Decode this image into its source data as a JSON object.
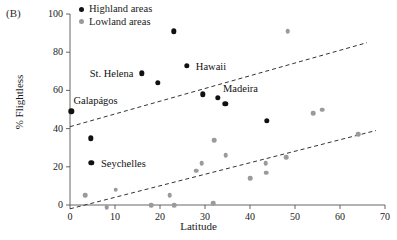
{
  "panel": {
    "label": "(B)"
  },
  "legend": {
    "items": [
      {
        "label": "Highland areas",
        "color": "#111111",
        "name": "highland"
      },
      {
        "label": "Lowland areas",
        "color": "#9a9a9a",
        "name": "lowland"
      }
    ]
  },
  "chart_data": {
    "type": "scatter",
    "title": "",
    "xlabel": "Latitude",
    "ylabel": "% Flightless",
    "xlim": [
      0,
      70
    ],
    "ylim": [
      0,
      100
    ],
    "xticks": [
      0,
      10,
      20,
      30,
      40,
      50,
      60,
      70
    ],
    "yticks": [
      0,
      20,
      40,
      60,
      80,
      100
    ],
    "grid": false,
    "legend_position": "top-left",
    "series": [
      {
        "name": "Highland areas",
        "color": "#111111",
        "points": [
          {
            "x": 0.3,
            "y": 49,
            "label": "Galapagos"
          },
          {
            "x": 4.6,
            "y": 35,
            "label": ""
          },
          {
            "x": 4.7,
            "y": 22,
            "label": "Seychelles"
          },
          {
            "x": 16.0,
            "y": 69,
            "label": "St. Helena"
          },
          {
            "x": 19.5,
            "y": 64,
            "label": ""
          },
          {
            "x": 23.0,
            "y": 91,
            "label": ""
          },
          {
            "x": 26.0,
            "y": 73,
            "label": "Hawaii"
          },
          {
            "x": 29.5,
            "y": 58,
            "label": ""
          },
          {
            "x": 32.8,
            "y": 56,
            "label": "Madeira"
          },
          {
            "x": 34.5,
            "y": 53,
            "label": ""
          },
          {
            "x": 43.8,
            "y": 44,
            "label": ""
          }
        ]
      },
      {
        "name": "Lowland areas",
        "color": "#9a9a9a",
        "points": [
          {
            "x": 3.4,
            "y": 5
          },
          {
            "x": 8.2,
            "y": -1
          },
          {
            "x": 10.2,
            "y": 8
          },
          {
            "x": 18.0,
            "y": 0
          },
          {
            "x": 22.2,
            "y": 5
          },
          {
            "x": 23.2,
            "y": 0
          },
          {
            "x": 28.0,
            "y": 18
          },
          {
            "x": 29.3,
            "y": 22
          },
          {
            "x": 31.8,
            "y": 1
          },
          {
            "x": 32.0,
            "y": 34
          },
          {
            "x": 34.6,
            "y": 26
          },
          {
            "x": 40.0,
            "y": 14
          },
          {
            "x": 43.5,
            "y": 22
          },
          {
            "x": 43.6,
            "y": 17
          },
          {
            "x": 48.0,
            "y": 25
          },
          {
            "x": 48.4,
            "y": 91
          },
          {
            "x": 54.0,
            "y": 48
          },
          {
            "x": 56.0,
            "y": 50
          },
          {
            "x": 64.0,
            "y": 37
          }
        ]
      }
    ],
    "trendlines": [
      {
        "name": "highland-trend",
        "style": "dashed",
        "x0": 0,
        "y0": 41,
        "x1": 66,
        "y1": 85
      },
      {
        "name": "lowland-trend",
        "style": "dashed",
        "x0": 0,
        "y0": -2,
        "x1": 68,
        "y1": 39
      }
    ],
    "point_labels": [
      {
        "text": "Galapágos",
        "x": 1.2,
        "y": 55,
        "anchor": "start",
        "dx": -2
      },
      {
        "text": "Seychelles",
        "x": 6.2,
        "y": 22,
        "anchor": "start",
        "dx": 3
      },
      {
        "text": "St. Helena",
        "x": 15.2,
        "y": 69,
        "anchor": "end",
        "dx": -5
      },
      {
        "text": "Hawaii",
        "x": 27.3,
        "y": 73,
        "anchor": "start",
        "dx": 3
      },
      {
        "text": "Madeira",
        "x": 34.0,
        "y": 61,
        "anchor": "start",
        "dx": 0
      }
    ]
  }
}
